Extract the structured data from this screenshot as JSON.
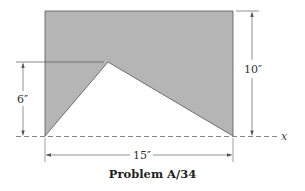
{
  "figure": {
    "caption": "Problem A/34",
    "shape": {
      "description": "Rectangle with triangular cutout from bottom edge",
      "fill_color": "#b5b5b5",
      "outline_color": "#555555"
    },
    "dimensions": {
      "height_total": "10″",
      "apex_height": "6″",
      "width": "15″"
    },
    "axis": {
      "label": "x"
    }
  }
}
